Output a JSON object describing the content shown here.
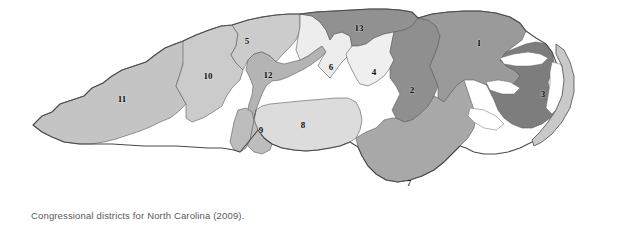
{
  "figure": {
    "caption": "Congressional districts for North Carolina (2009).",
    "title": "Congressional districts for North Carolina (2009)",
    "background_color": "#ffffff",
    "caption_color": "#59595b"
  },
  "map": {
    "region": "North Carolina",
    "year": "2009",
    "kind": "choropleth-outline",
    "outline_color": "#4a4a4a",
    "water_color": "#ffffff",
    "districts": [
      {
        "number": "1",
        "label": "1",
        "fill": "#9a9a9a",
        "label_x": 479,
        "label_y": 44
      },
      {
        "number": "2",
        "label": "2",
        "fill": "#8f8f8f",
        "label_x": 412,
        "label_y": 91
      },
      {
        "number": "3",
        "label": "3",
        "fill": "#7d7d7d",
        "label_x": 543,
        "label_y": 95
      },
      {
        "number": "4",
        "label": "4",
        "fill": "#efefef",
        "label_x": 374,
        "label_y": 73
      },
      {
        "number": "5",
        "label": "5",
        "fill": "#cccccc",
        "label_x": 247,
        "label_y": 42
      },
      {
        "number": "6",
        "label": "6",
        "fill": "#ededed",
        "label_x": 331,
        "label_y": 68
      },
      {
        "number": "7",
        "label": "7",
        "fill": "#a8a8a8",
        "label_x": 409,
        "label_y": 184
      },
      {
        "number": "8",
        "label": "8",
        "fill": "#dcdcdc",
        "label_x": 303,
        "label_y": 126
      },
      {
        "number": "9",
        "label": "9",
        "fill": "#bdbdbd",
        "label_x": 261,
        "label_y": 131
      },
      {
        "number": "10",
        "label": "10",
        "fill": "#cbcbcb",
        "label_x": 208,
        "label_y": 77
      },
      {
        "number": "11",
        "label": "11",
        "fill": "#c4c4c4",
        "label_x": 122,
        "label_y": 100
      },
      {
        "number": "12",
        "label": "12",
        "fill": "#b4b4b4",
        "label_x": 268,
        "label_y": 76
      },
      {
        "number": "13",
        "label": "13",
        "fill": "#919191",
        "label_x": 359,
        "label_y": 29
      }
    ]
  }
}
